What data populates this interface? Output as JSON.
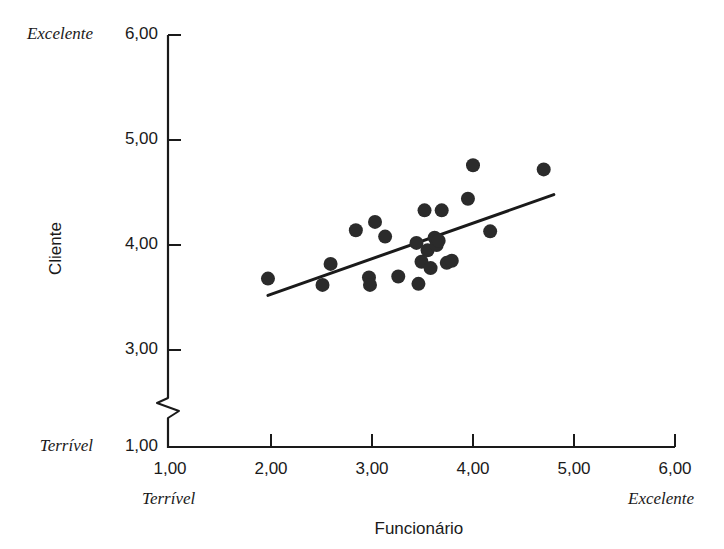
{
  "chart_data": {
    "type": "scatter",
    "title": "",
    "xlabel": "Funcionário",
    "ylabel": "Cliente",
    "xlim": [
      1.0,
      6.0
    ],
    "ylim": [
      1.0,
      6.0
    ],
    "y_axis_break": true,
    "y_break_between": [
      1.0,
      3.0
    ],
    "grid": false,
    "legend": null,
    "xticks": [
      "1,00",
      "2,00",
      "3,00",
      "4,00",
      "5,00",
      "6,00"
    ],
    "xtick_values": [
      1.0,
      2.0,
      3.0,
      4.0,
      5.0,
      6.0
    ],
    "yticks": [
      "1,00",
      "3,00",
      "4,00",
      "5,00",
      "6,00"
    ],
    "ytick_values": [
      1.0,
      3.0,
      4.0,
      5.0,
      6.0
    ],
    "x_anchor_low": "Terrível",
    "x_anchor_high": "Excelente",
    "y_anchor_low": "Terrível",
    "y_anchor_high": "Excelente",
    "marker_color": "#2b2b2b",
    "marker_radius": 7,
    "line_color": "#1a1a1a",
    "line_width": 3,
    "trendline": {
      "x0": 1.97,
      "y0": 3.52,
      "x1": 4.8,
      "y1": 4.48
    },
    "points": [
      {
        "x": 1.97,
        "y": 3.68
      },
      {
        "x": 2.51,
        "y": 3.62
      },
      {
        "x": 2.59,
        "y": 3.82
      },
      {
        "x": 2.84,
        "y": 4.14
      },
      {
        "x": 2.97,
        "y": 3.69
      },
      {
        "x": 2.98,
        "y": 3.62
      },
      {
        "x": 3.03,
        "y": 4.22
      },
      {
        "x": 3.13,
        "y": 4.08
      },
      {
        "x": 3.26,
        "y": 3.7
      },
      {
        "x": 3.44,
        "y": 4.02
      },
      {
        "x": 3.46,
        "y": 3.63
      },
      {
        "x": 3.49,
        "y": 3.84
      },
      {
        "x": 3.52,
        "y": 4.33
      },
      {
        "x": 3.55,
        "y": 3.95
      },
      {
        "x": 3.58,
        "y": 3.78
      },
      {
        "x": 3.62,
        "y": 4.07
      },
      {
        "x": 3.64,
        "y": 4.0
      },
      {
        "x": 3.66,
        "y": 4.04
      },
      {
        "x": 3.69,
        "y": 4.33
      },
      {
        "x": 3.74,
        "y": 3.83
      },
      {
        "x": 3.79,
        "y": 3.85
      },
      {
        "x": 3.95,
        "y": 4.44
      },
      {
        "x": 4.0,
        "y": 4.76
      },
      {
        "x": 4.17,
        "y": 4.13
      },
      {
        "x": 4.7,
        "y": 4.72
      }
    ]
  },
  "axis": {
    "y_title": "Cliente",
    "x_title": "Funcionário"
  }
}
